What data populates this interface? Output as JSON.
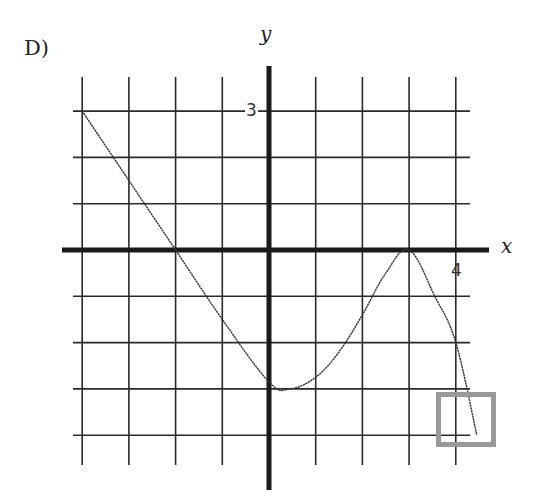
{
  "problem": {
    "choice_label": "D)",
    "x_axis_label": "x",
    "y_axis_label": "y",
    "y_tick_label": "3",
    "x_tick_label": "4"
  },
  "colors": {
    "grid": "#2a2a2a",
    "axes": "#1a1a1a",
    "curve": "#333333",
    "highlight_box": "#999999",
    "background": "#ffffff"
  },
  "chart_data": {
    "type": "line",
    "title": "D)",
    "xlabel": "x",
    "ylabel": "y",
    "xlim": [
      -4,
      4
    ],
    "ylim": [
      -4,
      3
    ],
    "grid": true,
    "grid_step": 1,
    "tick_labels": {
      "x": [
        "4"
      ],
      "y": [
        "3"
      ]
    },
    "series": [
      {
        "name": "f(x)",
        "x": [
          -4,
          -3,
          -2,
          -1,
          0,
          0.45,
          1,
          1.5,
          2,
          2.5,
          3,
          3.55,
          4,
          4.45
        ],
        "y": [
          3,
          1.5,
          0,
          -1.5,
          -2.85,
          -3,
          -2.75,
          -2.2,
          -1.4,
          -0.5,
          0,
          -1,
          -2,
          -4
        ]
      }
    ],
    "annotations": [
      {
        "type": "highlight_box",
        "x_range": [
          3.6,
          4.9
        ],
        "y_range": [
          -3,
          -4.2
        ],
        "color": "#999999",
        "note": "box around right end of curve"
      }
    ],
    "legend": null
  }
}
